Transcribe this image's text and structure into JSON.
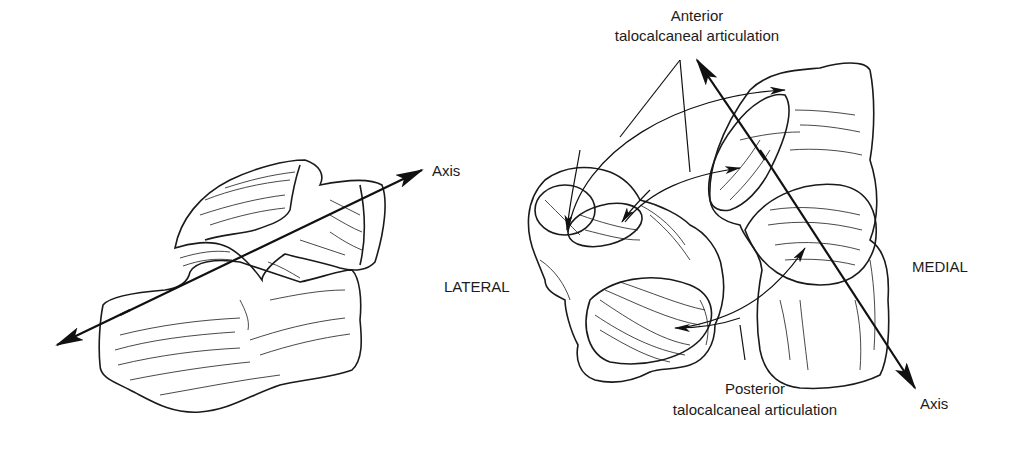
{
  "figure": {
    "left_view": {
      "axis_label": "Axis"
    },
    "right_view": {
      "anterior_label_line1": "Anterior",
      "anterior_label_line2": "talocalcaneal articulation",
      "posterior_label_line1": "Posterior",
      "posterior_label_line2": "talocalcaneal articulation",
      "lateral_label": "LATERAL",
      "medial_label": "MEDIAL",
      "axis_label": "Axis"
    },
    "colors": {
      "ink": "#1a1a1a",
      "background": "#ffffff"
    }
  }
}
